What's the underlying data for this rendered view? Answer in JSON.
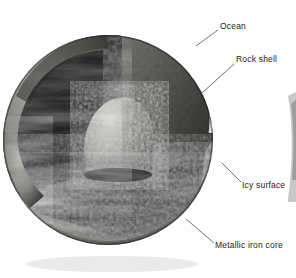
{
  "figure": {
    "type": "cross-section-diagram",
    "background_color": "#ffffff",
    "sphere": {
      "center_x": 108,
      "center_y": 140,
      "radius": 105,
      "cutaway_description": "octant wedge removed from upper-front-left revealing interior layers"
    },
    "labels": [
      {
        "id": "ocean",
        "text": "Ocean",
        "x": 220,
        "y": 21,
        "leader_from_x": 218,
        "leader_from_y": 30,
        "leader_to_x": 196,
        "leader_to_y": 46,
        "layer_color": "#f2f2f0"
      },
      {
        "id": "rock-shell",
        "text": "Rock shell",
        "x": 236,
        "y": 54,
        "leader_from_x": 234,
        "leader_from_y": 64,
        "leader_to_x": 172,
        "leader_to_y": 120,
        "layer_color": "#6e6e6a"
      },
      {
        "id": "icy-surface",
        "text": "Icy surface",
        "x": 242,
        "y": 180,
        "leader_from_x": 241,
        "leader_from_y": 182,
        "leader_to_x": 222,
        "leader_to_y": 163,
        "layer_color": "#b9b9b5"
      },
      {
        "id": "metallic-iron-core",
        "text": "Metallic iron core",
        "x": 215,
        "y": 240,
        "leader_from_x": 214,
        "leader_from_y": 243,
        "leader_to_x": 186,
        "leader_to_y": 219,
        "layer_color": "#8c8c88"
      }
    ],
    "layers": [
      {
        "name": "Icy surface",
        "order": 1,
        "position": "outermost",
        "tone": "light-gray mottled"
      },
      {
        "name": "Ocean",
        "order": 2,
        "position": "thin bright band beneath ice",
        "tone": "white"
      },
      {
        "name": "Rock shell",
        "order": 3,
        "position": "thick mantle",
        "tone": "mid-gray granular"
      },
      {
        "name": "Metallic iron core",
        "order": 4,
        "position": "central sphere",
        "tone": "bright speckled gray"
      }
    ],
    "colors": {
      "ice_light": "#c9c9c5",
      "ice_mid": "#9a9a96",
      "ice_dark": "#5a5a57",
      "ocean_band": "#f6f6f4",
      "rock_light": "#8a8a86",
      "rock_mid": "#5e5e5b",
      "rock_dark": "#3a3a38",
      "core_light": "#cfcfca",
      "core_mid": "#9b9b96",
      "core_dark": "#5c5c58",
      "cavity_black": "#070707",
      "floor_dark": "#1a1a18",
      "label_ink": "#1a1a1a",
      "leader_line": "#4a4a4a",
      "background": "#ffffff"
    }
  }
}
